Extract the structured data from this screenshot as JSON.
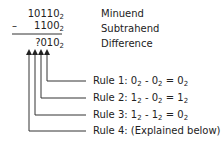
{
  "subtraction": {
    "minuend": {
      "digits": "10110",
      "base": "2",
      "label": "Minuend"
    },
    "subtrahend": {
      "operator": "–",
      "digits": "1100",
      "base": "2",
      "label": "Subtrahend"
    },
    "difference": {
      "digits": "?010",
      "base": "2",
      "label": "Difference"
    }
  },
  "rules": [
    {
      "prefix": "Rule 1: ",
      "a": "0",
      "op": " - ",
      "b": "0",
      "eq": " = ",
      "r": "0",
      "base": "2"
    },
    {
      "prefix": "Rule 2: ",
      "a": "1",
      "op": " - ",
      "b": "0",
      "eq": " = ",
      "r": "1",
      "base": "2"
    },
    {
      "prefix": "Rule 3: ",
      "a": "1",
      "op": " - ",
      "b": "1",
      "eq": " = ",
      "r": "0",
      "base": "2"
    },
    {
      "prefix": "Rule 4: (Explained below)"
    }
  ],
  "colors": {
    "text": "#222222",
    "lines": "#333333"
  }
}
